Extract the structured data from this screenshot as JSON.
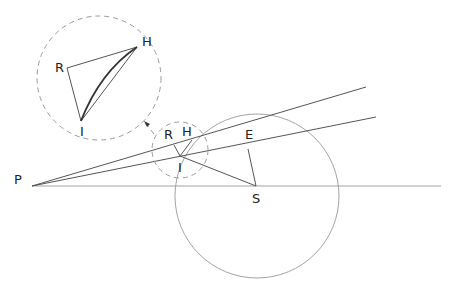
{
  "diagram": {
    "labels": {
      "P": "P",
      "R": "R",
      "H": "H",
      "I": "I",
      "E": "E",
      "S": "S",
      "inset_R": "R",
      "inset_H": "H",
      "inset_I": "I"
    },
    "points": {
      "P": [
        32,
        186
      ],
      "I": [
        180,
        156
      ],
      "H": [
        192,
        142
      ],
      "R": [
        172,
        151
      ],
      "E": [
        248,
        149
      ],
      "S": [
        256,
        186
      ]
    },
    "circles": {
      "large": {
        "cx": 257,
        "cy": 196,
        "r": 82
      },
      "small_dashed": {
        "cx": 180,
        "cy": 150,
        "r": 28
      },
      "inset_dashed": {
        "cx": 99,
        "cy": 78,
        "r": 62
      }
    },
    "inset_points": {
      "R": [
        67,
        68
      ],
      "H": [
        137,
        47
      ],
      "I": [
        81,
        121
      ]
    },
    "colors": {
      "line": "#555555",
      "circle": "#999999",
      "dashed": "#9a9a9a",
      "text": "#222222"
    }
  }
}
